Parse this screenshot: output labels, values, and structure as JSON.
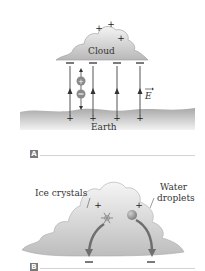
{
  "panel_a": {
    "tag": "A",
    "cloud_label": "Cloud",
    "earth_label": "Earth",
    "field_label": "E",
    "cloud_top_charges": [
      "+",
      "+",
      "+"
    ],
    "cloud_bottom_charge": "−",
    "ground_charge": "+",
    "field_line_count": 4,
    "particle_charges": [
      "+",
      "−"
    ]
  },
  "panel_b": {
    "tag": "B",
    "ice_label": "Ice crystals",
    "water_label_line1": "Water",
    "water_label_line2": "droplets",
    "top_charge": "+",
    "bottom_charge": "−"
  },
  "colors": {
    "cloud_fill": "#c4c4c4",
    "earth_fill": "#bdbdbd",
    "arrow": "#555555",
    "tag_bg": "#7a7a7a",
    "rule": "#d4d4d4"
  }
}
